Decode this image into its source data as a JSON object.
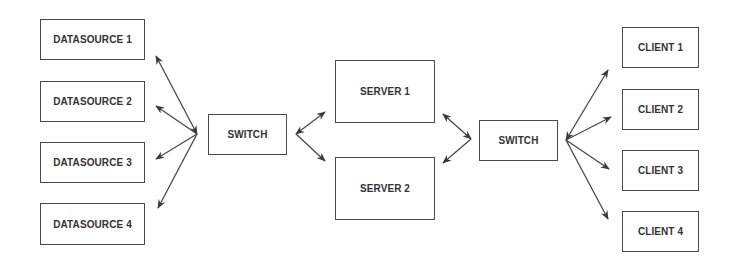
{
  "diagram": {
    "type": "network-topology",
    "colors": {
      "line": "#4a4a4a",
      "text": "#333333",
      "background": "#ffffff"
    },
    "datasources": [
      {
        "label": "DATASOURCE 1"
      },
      {
        "label": "DATASOURCE 2"
      },
      {
        "label": "DATASOURCE 3"
      },
      {
        "label": "DATASOURCE 4"
      }
    ],
    "switch_left": {
      "label": "SWITCH"
    },
    "servers": [
      {
        "label": "SERVER 1"
      },
      {
        "label": "SERVER 2"
      }
    ],
    "switch_right": {
      "label": "SWITCH"
    },
    "clients": [
      {
        "label": "CLIENT 1"
      },
      {
        "label": "CLIENT 2"
      },
      {
        "label": "CLIENT 3"
      },
      {
        "label": "CLIENT 4"
      }
    ],
    "edges": [
      {
        "from": "DATASOURCE 1",
        "to": "SWITCH",
        "direction": "bidirectional"
      },
      {
        "from": "DATASOURCE 2",
        "to": "SWITCH",
        "direction": "bidirectional"
      },
      {
        "from": "DATASOURCE 3",
        "to": "SWITCH",
        "direction": "bidirectional"
      },
      {
        "from": "DATASOURCE 4",
        "to": "SWITCH",
        "direction": "bidirectional"
      },
      {
        "from": "SWITCH",
        "to": "SERVER 1",
        "direction": "bidirectional"
      },
      {
        "from": "SWITCH",
        "to": "SERVER 2",
        "direction": "bidirectional"
      },
      {
        "from": "SERVER 1",
        "to": "SWITCH",
        "direction": "bidirectional"
      },
      {
        "from": "SERVER 2",
        "to": "SWITCH",
        "direction": "bidirectional"
      },
      {
        "from": "SWITCH",
        "to": "CLIENT 1",
        "direction": "bidirectional"
      },
      {
        "from": "SWITCH",
        "to": "CLIENT 2",
        "direction": "bidirectional"
      },
      {
        "from": "SWITCH",
        "to": "CLIENT 3",
        "direction": "bidirectional"
      },
      {
        "from": "SWITCH",
        "to": "CLIENT 4",
        "direction": "bidirectional"
      }
    ]
  }
}
